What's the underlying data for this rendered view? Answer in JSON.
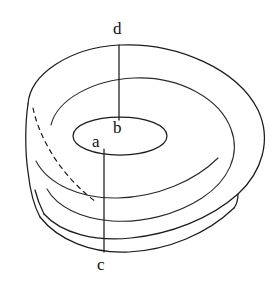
{
  "figure": {
    "kind": "line-diagram",
    "background_color": "#ffffff",
    "stroke_color": "#1b1b1b",
    "canvas": {
      "width": 279,
      "height": 281
    },
    "labels": [
      {
        "id": "d",
        "text": "d",
        "x": 113,
        "y": 20,
        "anchor": "top-outer-rim"
      },
      {
        "id": "b",
        "text": "b",
        "x": 113,
        "y": 119,
        "anchor": "inner-rim-top"
      },
      {
        "id": "a",
        "text": "a",
        "x": 92,
        "y": 133,
        "anchor": "inner-rim-front"
      },
      {
        "id": "c",
        "text": "c",
        "x": 97,
        "y": 256,
        "anchor": "bottom-outer-rim"
      }
    ],
    "segments": [
      {
        "id": "db",
        "from": "d",
        "to": "b",
        "style": "solid",
        "description": "outer-top-rim-to-inner-rim radius line"
      },
      {
        "id": "ac",
        "from": "a",
        "to": "c",
        "style": "solid",
        "description": "inner-rim-front-to-bottom-outer-rim line"
      }
    ],
    "hidden_edges": [
      {
        "id": "inner-wall-hidden-arc",
        "style": "dashed",
        "description": "hidden inner cylinder wall arc at cutaway"
      }
    ],
    "geometry": {
      "outer_top_ellipse": {
        "cx": 142,
        "cy": 132,
        "rx": 120,
        "ry": 87
      },
      "middle_top_ellipse": {
        "cx": 137,
        "cy": 136,
        "rx": 88,
        "ry": 62
      },
      "inner_hole_ellipse": {
        "cx": 120,
        "cy": 136,
        "rx": 47,
        "ry": 19
      },
      "wall_height": 64
    }
  }
}
